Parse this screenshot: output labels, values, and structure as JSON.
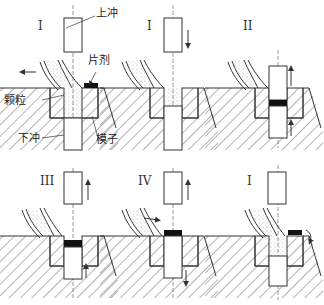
{
  "diagram": {
    "panels": [
      {
        "id": "p1",
        "roman": "I",
        "stage": "fill / eject",
        "upper_arrow": "none",
        "lower_arrow": "none",
        "feed_arrow": "left",
        "tablet": "ejected-right"
      },
      {
        "id": "p2",
        "roman": "I",
        "stage": "upper punch descends",
        "upper_arrow": "down",
        "lower_arrow": "none",
        "feed_arrow": "none",
        "tablet": "none"
      },
      {
        "id": "p3",
        "roman": "II",
        "stage": "compression",
        "upper_arrow": "up",
        "lower_arrow": "up",
        "feed_arrow": "none",
        "tablet": "compressed-in-die"
      },
      {
        "id": "p4",
        "roman": "III",
        "stage": "upper punch rises",
        "upper_arrow": "up",
        "lower_arrow": "up",
        "feed_arrow": "none",
        "tablet": "in-die"
      },
      {
        "id": "p5",
        "roman": "IV",
        "stage": "ejection",
        "upper_arrow": "up",
        "lower_arrow": "down",
        "feed_arrow": "right",
        "tablet": "top-of-die"
      },
      {
        "id": "p6",
        "roman": "I",
        "stage": "refill",
        "upper_arrow": "none",
        "lower_arrow": "none",
        "feed_arrow": "none",
        "tablet": "ejected-right"
      }
    ],
    "labels": {
      "upper_punch": "上冲",
      "tablet": "片剂",
      "granules": "颗粒",
      "lower_punch": "下冲",
      "die": "模子"
    },
    "colors": {
      "line": "#333333",
      "tablet": "#111111",
      "granule": "#999999"
    }
  }
}
